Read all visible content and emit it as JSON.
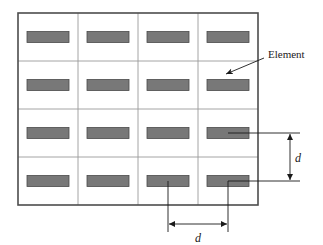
{
  "figure": {
    "type": "array-antenna-element-layout-diagram",
    "background_color": "#ffffff",
    "panel": {
      "name": "array-panel",
      "x": 18,
      "y": 13,
      "width": 240,
      "height": 192,
      "border_color": "#4d4d4d",
      "border_width": 1.6,
      "fill": "#ffffff"
    },
    "grid": {
      "columns": 4,
      "rows": 4,
      "cell_width": 60,
      "cell_height": 48,
      "line_color": "#9a9a9a",
      "line_width": 0.9,
      "vertical_dividers_x": [
        78,
        138,
        198
      ],
      "horizontal_dividers_y": [
        61,
        109,
        157
      ]
    },
    "element": {
      "label": "Element",
      "width": 42,
      "height": 11,
      "fill_color": "#787878",
      "stroke_color": "#4a4a4a",
      "stroke_width": 0.8,
      "centers_x": [
        48,
        108,
        168,
        228
      ],
      "centers_y": [
        37,
        85,
        133,
        181
      ],
      "count": 16
    },
    "callout": {
      "label": "Element",
      "text_x": 268,
      "text_y": 62,
      "line_from_x": 264,
      "line_from_y": 58,
      "line_to_x": 224,
      "line_to_y": 75,
      "arrow_target": "element-row2-col4",
      "color": "#1a1a1a"
    },
    "dimension_vertical": {
      "label": "d",
      "meaning": "vertical element spacing",
      "extension_from_y": 133,
      "extension_to_y": 181,
      "extension_start_x": 228,
      "extension_end_x": 300,
      "arrow_x": 290,
      "label_x": 295,
      "label_y": 161,
      "color": "#1a1a1a"
    },
    "dimension_horizontal": {
      "label": "d",
      "meaning": "horizontal element spacing",
      "extension_from_x": 168,
      "extension_to_x": 228,
      "extension_start_y": 181,
      "extension_end_y": 232,
      "arrow_y": 224,
      "label_x": 198,
      "label_y": 241,
      "color": "#1a1a1a"
    }
  }
}
